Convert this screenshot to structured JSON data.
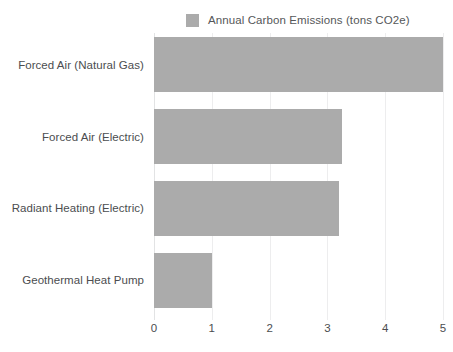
{
  "legend": {
    "swatch_name": "legend-color-swatch",
    "label": "Annual Carbon Emissions (tons CO2e)",
    "color": "#ababab"
  },
  "axes": {
    "x_ticks": [
      "0",
      "1",
      "2",
      "3",
      "4",
      "5"
    ],
    "y_categories": [
      "Forced Air (Natural Gas)",
      "Forced Air (Electric)",
      "Radiant Heating (Electric)",
      "Geothermal Heat Pump"
    ]
  },
  "colors": {
    "bar": "#ababab",
    "text": "#4b4d4f",
    "gridline": "#ededee",
    "background": "#ffffff"
  },
  "chart_data": {
    "type": "bar",
    "orientation": "horizontal",
    "title": "",
    "subtitle": "",
    "xlabel": "",
    "ylabel": "",
    "categories": [
      "Forced Air (Natural Gas)",
      "Forced Air (Electric)",
      "Radiant Heating (Electric)",
      "Geothermal Heat Pump"
    ],
    "values": [
      5.0,
      3.25,
      3.2,
      1.0
    ],
    "series": [
      {
        "name": "Annual Carbon Emissions (tons CO2e)",
        "color": "#ababab",
        "values": [
          5.0,
          3.25,
          3.2,
          1.0
        ]
      }
    ],
    "xlim": [
      0,
      5
    ],
    "xticks": [
      0,
      1,
      2,
      3,
      4,
      5
    ],
    "xticklabels": [
      "0",
      "1",
      "2",
      "3",
      "4",
      "5"
    ],
    "grid": true,
    "grid_axis": "x",
    "legend": true,
    "legend_position": "top",
    "legend_entries": [
      "Annual Carbon Emissions (tons CO2e)"
    ],
    "annotations": [],
    "data_labels": false
  }
}
